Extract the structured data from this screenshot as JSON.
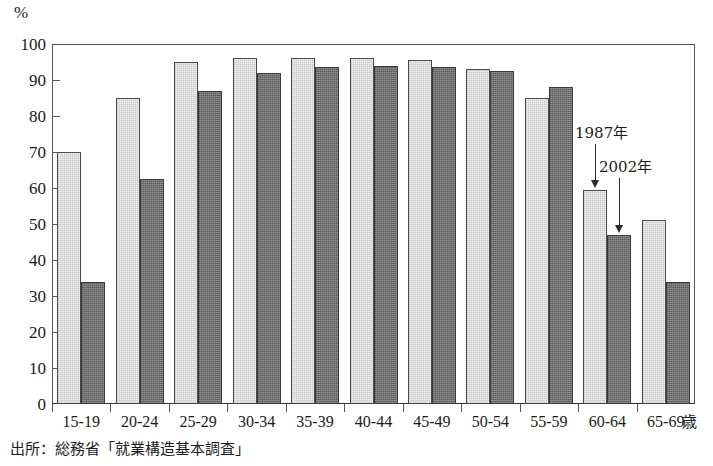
{
  "chart_data": {
    "type": "bar",
    "title": "",
    "xlabel": "歳",
    "ylabel": "%",
    "unit_label": "%",
    "ylim": [
      0,
      100
    ],
    "ytick_step": 10,
    "yticks": [
      0,
      10,
      20,
      30,
      40,
      50,
      60,
      70,
      80,
      90,
      100
    ],
    "ytick_labels": [
      "0",
      "10",
      "20",
      "30",
      "40",
      "50",
      "60",
      "70",
      "80",
      "90",
      "100"
    ],
    "grid": false,
    "legend_position": "annotation-arrows",
    "categories": [
      "15-19",
      "20-24",
      "25-29",
      "30-34",
      "35-39",
      "40-44",
      "45-49",
      "50-54",
      "55-59",
      "60-64",
      "65-69"
    ],
    "series": [
      {
        "name": "1987年",
        "key": "y1987",
        "style": "light",
        "color": "#f1f1f1",
        "values": [
          70,
          85,
          95,
          96,
          96,
          96,
          95.5,
          93,
          85,
          59.5,
          51
        ]
      },
      {
        "name": "2002年",
        "key": "y2002",
        "style": "dark",
        "color": "#6f6f6f",
        "values": [
          34,
          62.5,
          87,
          92,
          93.5,
          94,
          93.5,
          92.5,
          88,
          47,
          34
        ]
      }
    ],
    "annotations": [
      {
        "text": "1987年",
        "points_to_series": "1987年",
        "points_to_category": "60-64"
      },
      {
        "text": "2002年",
        "points_to_series": "2002年",
        "points_to_category": "60-64"
      }
    ],
    "source_note": "出所：総務省「就業構造基本調査」"
  },
  "axis": {
    "unit_label": "%",
    "x_unit": "歳",
    "ytick_labels": [
      "100",
      "90",
      "80",
      "70",
      "60",
      "50",
      "40",
      "30",
      "20",
      "10",
      "0"
    ],
    "xtick_labels": [
      "15-19",
      "20-24",
      "25-29",
      "30-34",
      "35-39",
      "40-44",
      "45-49",
      "50-54",
      "55-59",
      "60-64",
      "65-69"
    ]
  },
  "annotations": {
    "label_1987": "1987年",
    "label_2002": "2002年"
  },
  "footer": {
    "source_note": "出所：総務省「就業構造基本調査」"
  }
}
